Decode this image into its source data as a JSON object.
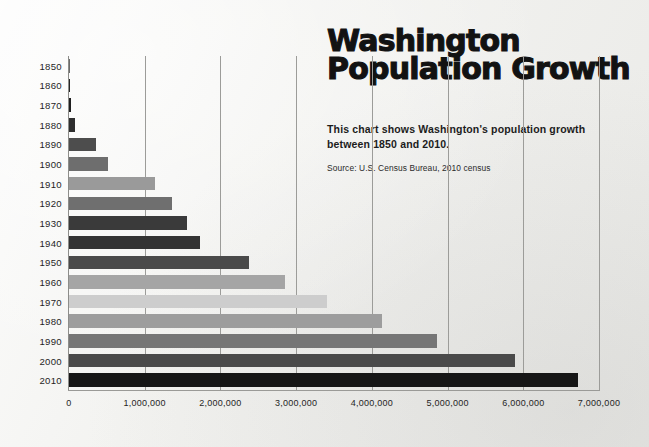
{
  "title_lines": [
    "Washington",
    "Population Growth"
  ],
  "description": "This chart shows Washington's population growth between 1850 and 2010.",
  "source": "Source: U.S. Census Bureau, 2010 census",
  "background_color": "#efefec",
  "chart_data": {
    "type": "bar",
    "orientation": "horizontal",
    "title": "Washington Population Growth",
    "subtitle": "This chart shows Washington's population growth between 1850 and 2010.",
    "source": "Source: U.S. Census Bureau, 2010 census",
    "xlabel": "",
    "ylabel": "",
    "xlim": [
      0,
      7000000
    ],
    "grid": true,
    "legend": "none",
    "categories": [
      "1850",
      "1860",
      "1870",
      "1880",
      "1890",
      "1900",
      "1910",
      "1920",
      "1930",
      "1940",
      "1950",
      "1960",
      "1970",
      "1980",
      "1990",
      "2000",
      "2010"
    ],
    "values": [
      1201,
      11594,
      23955,
      75116,
      357232,
      518103,
      1141990,
      1356621,
      1563396,
      1736191,
      2378963,
      2853214,
      3413244,
      4132156,
      4866692,
      5894121,
      6724540
    ],
    "xticks": [
      0,
      1000000,
      2000000,
      3000000,
      4000000,
      5000000,
      6000000,
      7000000
    ],
    "xtick_labels": [
      "0",
      "1,000,000",
      "2,000,000",
      "3,000,000",
      "4,000,000",
      "5,000,000",
      "6,000,000",
      "7,000,000"
    ],
    "bar_colors": [
      "#6b6b6b",
      "#262626",
      "#1f1f1f",
      "#2e2e2e",
      "#4d4d4d",
      "#6e6e6e",
      "#9a9a9a",
      "#6f6f6f",
      "#3a3a3a",
      "#333333",
      "#4a4a4a",
      "#a5a5a5",
      "#cdcdcd",
      "#9d9d9d",
      "#767676",
      "#4a4a4a",
      "#161616"
    ]
  }
}
